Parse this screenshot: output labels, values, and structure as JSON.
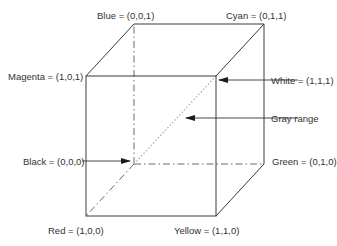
{
  "colors": {
    "line": "#3a3a3a",
    "hidden_line": "#6a6a6a",
    "gray_diagonal": "#b0b0b0",
    "text": "#333333",
    "background": "#ffffff"
  },
  "vertices": {
    "blue": {
      "label": "Blue = (0,0,1)",
      "rgb": [
        0,
        0,
        1
      ]
    },
    "cyan": {
      "label": "Cyan = (0,1,1)",
      "rgb": [
        0,
        1,
        1
      ]
    },
    "magenta": {
      "label": "Magenta = (1,0,1)",
      "rgb": [
        1,
        0,
        1
      ]
    },
    "white": {
      "label": "White = (1,1,1)",
      "rgb": [
        1,
        1,
        1
      ]
    },
    "black": {
      "label": "Black = (0,0,0)",
      "rgb": [
        0,
        0,
        0
      ]
    },
    "green": {
      "label": "Green = (0,1,0)",
      "rgb": [
        0,
        1,
        0
      ]
    },
    "red": {
      "label": "Red = (1,0,0)",
      "rgb": [
        1,
        0,
        0
      ]
    },
    "yellow": {
      "label": "Yellow = (1,1,0)",
      "rgb": [
        1,
        1,
        0
      ]
    }
  },
  "annotations": {
    "gray_range": "Gray range"
  }
}
